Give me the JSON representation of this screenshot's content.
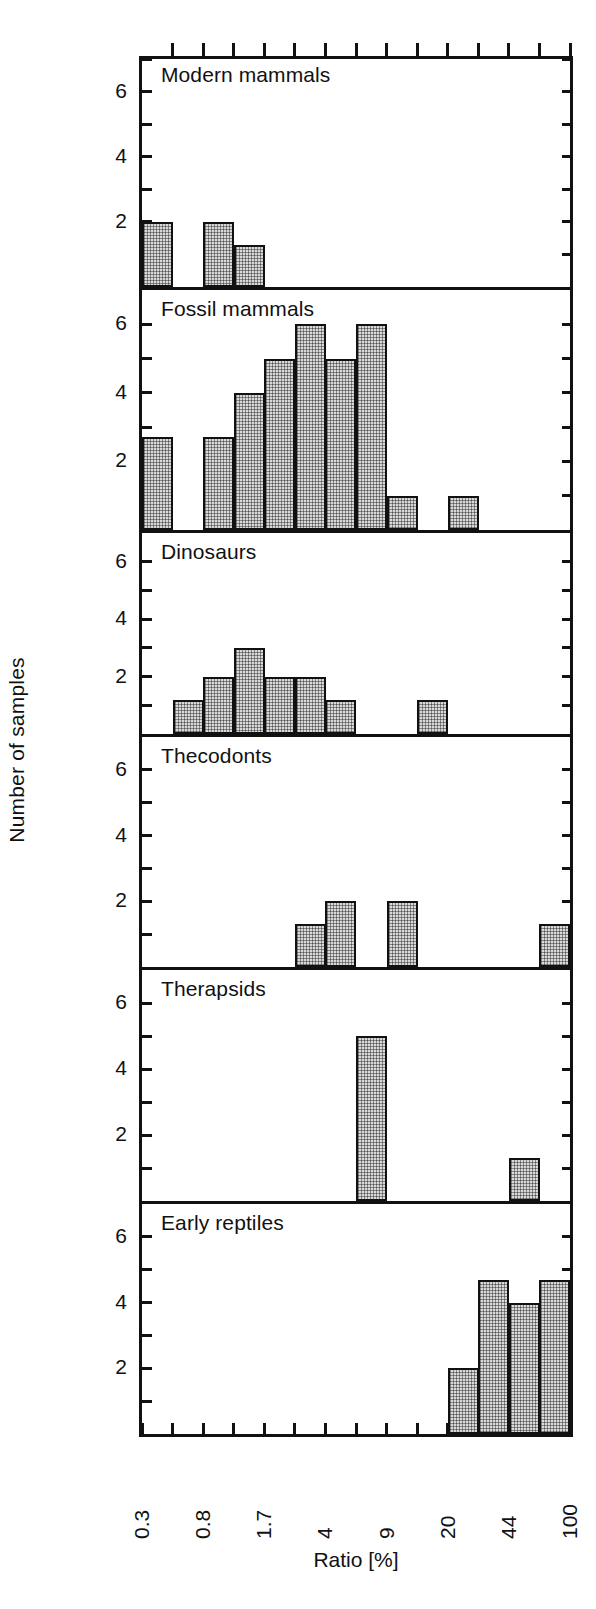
{
  "chart_data": {
    "type": "bar",
    "title": "",
    "xlabel": "Ratio [%]",
    "ylabel": "Number of samples",
    "ylim": [
      0,
      7
    ],
    "yticks": [
      1,
      2,
      3,
      4,
      5,
      6,
      7
    ],
    "ytick_labels": [
      "",
      "2",
      "",
      "4",
      "",
      "6",
      ""
    ],
    "ytick_labeled": [
      2,
      4,
      6
    ],
    "grid": false,
    "legend": false,
    "x_scale": "log",
    "n_bins": 14,
    "xtick_labels": [
      "0.3",
      "0.8",
      "1.7",
      "4",
      "9",
      "20",
      "44",
      "100"
    ],
    "xtick_bin_positions": [
      0,
      2,
      4,
      6,
      8,
      10,
      12,
      14
    ],
    "panels": [
      {
        "name": "modern-mammals",
        "label": "Modern mammals",
        "values": [
          2,
          0,
          2,
          1.3,
          0,
          0,
          0,
          0,
          0,
          0,
          0,
          0,
          0,
          0
        ]
      },
      {
        "name": "fossil-mammals",
        "label": "Fossil mammals",
        "values": [
          2.7,
          0,
          2.7,
          4,
          5,
          6,
          5,
          6,
          1,
          0,
          1,
          0,
          0,
          0
        ]
      },
      {
        "name": "dinosaurs",
        "label": "Dinosaurs",
        "values": [
          0,
          1.2,
          2,
          3,
          2,
          2,
          1.2,
          0,
          0,
          1.2,
          0,
          0,
          0,
          0
        ]
      },
      {
        "name": "thecodonts",
        "label": "Thecodonts",
        "values": [
          0,
          0,
          0,
          0,
          0,
          1.3,
          2,
          0,
          2,
          0,
          0,
          0,
          0,
          1.3
        ]
      },
      {
        "name": "therapsids",
        "label": "Therapsids",
        "values": [
          0,
          0,
          0,
          0,
          0,
          0,
          0,
          5,
          0,
          0,
          0,
          0,
          1.3,
          0
        ]
      },
      {
        "name": "early-reptiles",
        "label": "Early reptiles",
        "values": [
          0,
          0,
          0,
          0,
          0,
          0,
          0,
          0,
          0,
          0,
          2,
          4.7,
          4,
          4.7
        ]
      }
    ]
  },
  "colors": {
    "axis": "#111111",
    "bar_fill": "#d9d9d9",
    "bar_edge": "#111111",
    "background": "#ffffff"
  }
}
